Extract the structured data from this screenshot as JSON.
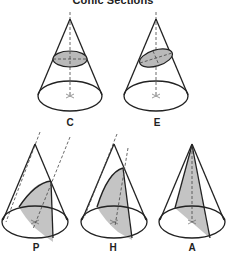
{
  "title": "Conic Sections",
  "colors": {
    "line": "#222222",
    "section_fill": "#b9b9b9",
    "shade_fill": "#c4c4c4",
    "background": "#ffffff"
  },
  "cones": [
    {
      "id": "circle",
      "label": "C",
      "section": "circle"
    },
    {
      "id": "ellipse",
      "label": "E",
      "section": "ellipse"
    },
    {
      "id": "parabola",
      "label": "P",
      "section": "parabola"
    },
    {
      "id": "hyperbola",
      "label": "H",
      "section": "hyperbola"
    },
    {
      "id": "axial",
      "label": "A",
      "section": "triangle"
    }
  ]
}
